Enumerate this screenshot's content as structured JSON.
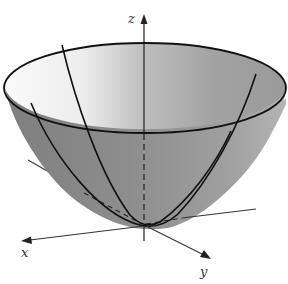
{
  "figure": {
    "surface": "paraboloid",
    "axes": {
      "x_label": "x",
      "y_label": "y",
      "z_label": "z"
    },
    "colors": {
      "background": "#ffffff",
      "surface_outer": "#8c8c8c",
      "surface_inner_light": "#f4f4f4",
      "surface_inner_dark": "#9a9a9a",
      "lines": "#111111",
      "axes": "#333333"
    },
    "traces": [
      {
        "name": "xz-plane trace",
        "type": "parabola"
      },
      {
        "name": "yz-plane trace",
        "type": "parabola"
      }
    ],
    "rim": {
      "type": "ellipse"
    }
  }
}
